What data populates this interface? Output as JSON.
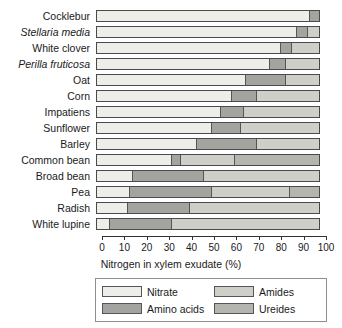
{
  "chart_data": {
    "type": "bar",
    "orientation": "horizontal",
    "stacked": true,
    "title": "",
    "xlabel": "Nitrogen in xylem exudate (%)",
    "ylabel": "",
    "xlim": [
      0,
      100
    ],
    "xticks": [
      0,
      10,
      20,
      30,
      40,
      50,
      60,
      70,
      80,
      90,
      100
    ],
    "xtick_labels": [
      "0",
      "10",
      "20",
      "30",
      "40",
      "50",
      "60",
      "70",
      "80",
      "90",
      "100"
    ],
    "grid": false,
    "legend_position": "bottom",
    "categories": [
      "Cocklebur",
      "Stellaria media",
      "White clover",
      "Perilla fruticosa",
      "Oat",
      "Corn",
      "Impatiens",
      "Sunflower",
      "Barley",
      "Common bean",
      "Broad bean",
      "Pea",
      "Radish",
      "White lupine"
    ],
    "category_styles": [
      "normal",
      "italic",
      "normal",
      "italic",
      "normal",
      "normal",
      "normal",
      "normal",
      "normal",
      "normal",
      "normal",
      "normal",
      "normal",
      "normal"
    ],
    "series": [
      {
        "name": "Nitrate",
        "color": "#ededea",
        "values": [
          96,
          90,
          83,
          78,
          67,
          61,
          56,
          52,
          45,
          34,
          16,
          15,
          14,
          6
        ]
      },
      {
        "name": "Amino acids",
        "color": "#a3a3a0",
        "values": [
          4,
          5,
          5,
          7,
          18,
          11,
          10,
          13,
          27,
          4,
          32,
          37,
          28,
          28
        ]
      },
      {
        "name": "Amides",
        "color": "#cfcfca",
        "values": [
          0,
          5,
          12,
          15,
          15,
          28,
          34,
          35,
          28,
          24,
          52,
          35,
          58,
          66
        ]
      },
      {
        "name": "Ureides",
        "color": "#b5b5b0",
        "values": [
          0,
          0,
          0,
          0,
          0,
          0,
          0,
          0,
          0,
          38,
          0,
          13,
          0,
          0
        ]
      }
    ]
  },
  "legend": {
    "items": [
      {
        "label": "Nitrate",
        "color": "#ededea"
      },
      {
        "label": "Amides",
        "color": "#cfcfca"
      },
      {
        "label": "Amino acids",
        "color": "#a3a3a0"
      },
      {
        "label": "Ureides",
        "color": "#b5b5b0"
      }
    ]
  }
}
